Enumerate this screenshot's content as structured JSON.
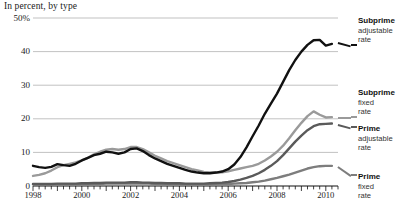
{
  "chart_title": "In percent, by type",
  "axes": {
    "y_ticks": [
      "50%",
      "40",
      "30",
      "20",
      "10",
      "0"
    ],
    "x_ticks": [
      "1998",
      "2000",
      "2002",
      "2004",
      "2006",
      "2008",
      "2010"
    ]
  },
  "legend": {
    "entries": [
      {
        "name": "Subprime",
        "line1": "adjustable",
        "line2": "rate",
        "color": "#111111"
      },
      {
        "name": "Subprime",
        "line1": "fixed",
        "line2": "rate",
        "color": "#9a9a9a"
      },
      {
        "name": "Prime",
        "line1": "adjustable",
        "line2": "rate",
        "color": "#5a5a5a"
      },
      {
        "name": "Prime",
        "line1": "fixed",
        "line2": "rate",
        "color": "#7d7d7d"
      }
    ]
  },
  "chart_data": {
    "type": "line",
    "title": "In percent, by type",
    "xlabel": "",
    "ylabel": "In percent",
    "xlim": [
      1998,
      2010.5
    ],
    "ylim": [
      0,
      50
    ],
    "ytick_values": [
      0,
      10,
      20,
      30,
      40,
      50
    ],
    "xtick_values": [
      1998,
      2000,
      2002,
      2004,
      2006,
      2008,
      2010
    ],
    "grid": "horizontal",
    "legend_position": "right",
    "x": [
      1998,
      1998.25,
      1998.5,
      1998.75,
      1999,
      1999.25,
      1999.5,
      1999.75,
      2000,
      2000.25,
      2000.5,
      2000.75,
      2001,
      2001.25,
      2001.5,
      2001.75,
      2002,
      2002.25,
      2002.5,
      2002.75,
      2003,
      2003.25,
      2003.5,
      2003.75,
      2004,
      2004.25,
      2004.5,
      2004.75,
      2005,
      2005.25,
      2005.5,
      2005.75,
      2006,
      2006.25,
      2006.5,
      2006.75,
      2007,
      2007.25,
      2007.5,
      2007.75,
      2008,
      2008.25,
      2008.5,
      2008.75,
      2009,
      2009.25,
      2009.5,
      2009.75,
      2010,
      2010.25
    ],
    "series": [
      {
        "name": "Subprime adjustable rate",
        "color": "#111111",
        "values": [
          6.0,
          5.6,
          5.4,
          5.7,
          6.5,
          6.2,
          6.0,
          6.6,
          7.6,
          8.4,
          9.2,
          9.6,
          10.2,
          10.0,
          9.6,
          10.0,
          11.0,
          11.2,
          10.4,
          9.2,
          8.2,
          7.4,
          6.6,
          6.0,
          5.4,
          4.8,
          4.3,
          4.0,
          3.8,
          3.8,
          4.0,
          4.3,
          5.0,
          6.4,
          8.6,
          11.5,
          14.8,
          18.0,
          21.5,
          24.5,
          27.5,
          31.0,
          34.5,
          37.5,
          40.0,
          42.0,
          43.4,
          43.5,
          41.8,
          42.3
        ]
      },
      {
        "name": "Subprime fixed rate",
        "color": "#9a9a9a",
        "values": [
          3.0,
          3.3,
          3.8,
          4.6,
          5.6,
          6.2,
          6.6,
          7.0,
          7.6,
          8.4,
          9.4,
          10.2,
          10.8,
          11.0,
          10.8,
          11.0,
          11.6,
          11.6,
          11.0,
          10.0,
          9.0,
          8.2,
          7.4,
          6.8,
          6.2,
          5.6,
          5.0,
          4.6,
          4.2,
          4.0,
          4.0,
          4.1,
          4.4,
          4.8,
          5.2,
          5.6,
          6.0,
          6.6,
          7.6,
          8.8,
          10.2,
          12.0,
          14.2,
          16.6,
          18.8,
          20.8,
          22.2,
          21.2,
          20.4,
          20.5
        ]
      },
      {
        "name": "Prime adjustable rate",
        "color": "#5a5a5a",
        "values": [
          0.6,
          0.6,
          0.6,
          0.6,
          0.7,
          0.7,
          0.7,
          0.7,
          0.8,
          0.8,
          0.9,
          0.9,
          1.0,
          1.0,
          1.0,
          1.0,
          1.1,
          1.1,
          1.0,
          1.0,
          0.9,
          0.9,
          0.8,
          0.8,
          0.8,
          0.7,
          0.7,
          0.7,
          0.7,
          0.8,
          0.9,
          1.0,
          1.2,
          1.5,
          1.9,
          2.4,
          3.0,
          3.8,
          4.8,
          6.0,
          7.4,
          9.2,
          11.2,
          13.2,
          15.0,
          16.6,
          17.8,
          18.4,
          18.5,
          18.6
        ]
      },
      {
        "name": "Prime fixed rate",
        "color": "#7d7d7d",
        "values": [
          0.5,
          0.5,
          0.5,
          0.5,
          0.5,
          0.5,
          0.5,
          0.5,
          0.6,
          0.6,
          0.6,
          0.6,
          0.7,
          0.7,
          0.7,
          0.7,
          0.7,
          0.7,
          0.7,
          0.7,
          0.6,
          0.6,
          0.6,
          0.6,
          0.6,
          0.5,
          0.5,
          0.5,
          0.5,
          0.5,
          0.5,
          0.6,
          0.6,
          0.7,
          0.8,
          0.9,
          1.1,
          1.3,
          1.6,
          2.0,
          2.4,
          2.9,
          3.4,
          4.0,
          4.6,
          5.2,
          5.6,
          5.9,
          6.0,
          6.0
        ]
      }
    ]
  }
}
